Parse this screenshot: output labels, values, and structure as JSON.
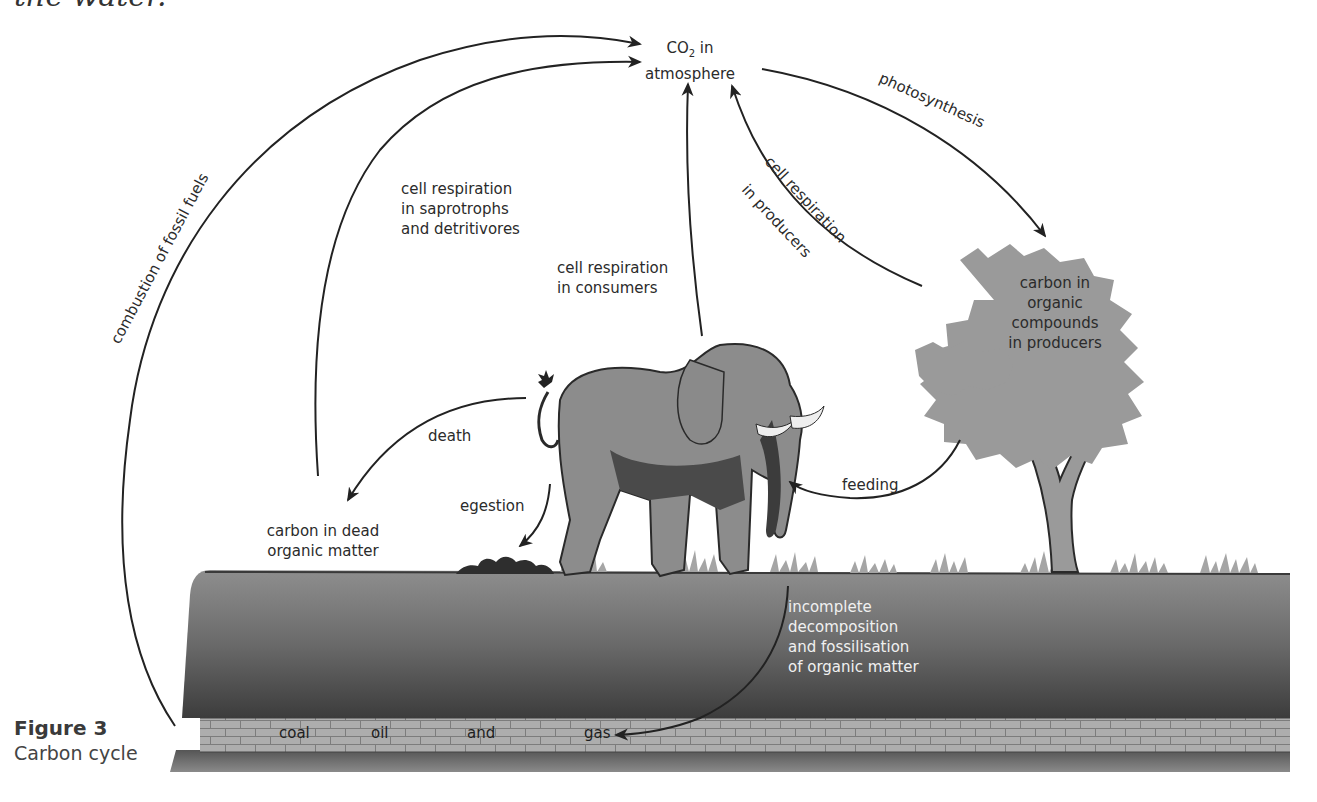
{
  "page": {
    "top_cut_text": "the water."
  },
  "figure": {
    "number": "Figure 3",
    "caption": "Carbon cycle"
  },
  "nodes": {
    "atmosphere": {
      "line1_prefix": "CO",
      "line1_sub": "2",
      "line1_suffix": " in",
      "line2": "atmosphere"
    },
    "producers": {
      "lines": [
        "carbon in",
        "organic",
        "compounds",
        "in producers"
      ]
    },
    "dead_matter": {
      "lines": [
        "carbon in dead",
        "organic matter"
      ]
    },
    "fossil_fuels": {
      "words": [
        "coal",
        "oil",
        "and",
        "gas"
      ]
    }
  },
  "processes": {
    "combustion": "combustion of fossil fuels",
    "photosynthesis": "photosynthesis",
    "resp_producers_1": "cell respiration",
    "resp_producers_2": "in producers",
    "resp_saprotrophs": [
      "cell respiration",
      "in saprotrophs",
      "and detritivores"
    ],
    "resp_consumers": [
      "cell respiration",
      "in consumers"
    ],
    "death": "death",
    "egestion": "egestion",
    "feeding": "feeding",
    "fossilisation": [
      "incomplete",
      "decomposition",
      "and fossilisation",
      "of organic matter"
    ]
  },
  "colors": {
    "arrow": "#222222",
    "soil_top": "#8a8a8a",
    "soil_bottom": "#3a3a3a",
    "rock_layer": "#a9a9a9",
    "tree_foliage": "#9a9a9a",
    "elephant": "#8c8c8c"
  }
}
